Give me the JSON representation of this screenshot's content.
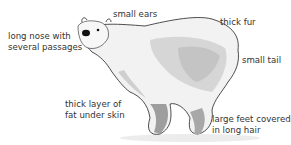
{
  "diagram": {
    "labels": [
      {
        "id": "ears",
        "lines": [
          "small ears"
        ]
      },
      {
        "id": "fur",
        "lines": [
          "thick fur"
        ]
      },
      {
        "id": "nose",
        "lines": [
          "long nose with",
          "several passages"
        ]
      },
      {
        "id": "tail",
        "lines": [
          "small tail"
        ]
      },
      {
        "id": "fat",
        "lines": [
          "thick layer of",
          "fat under skin"
        ]
      },
      {
        "id": "feet",
        "lines": [
          "large feet covered",
          "in long hair"
        ]
      }
    ]
  },
  "colors": {
    "text": "#333333",
    "outline": "#222222",
    "fur_light": "#f4f4f4",
    "fur_mid": "#d9d9d9",
    "fur_dark": "#b8b8b8",
    "shadow": "#e6e6e6"
  }
}
